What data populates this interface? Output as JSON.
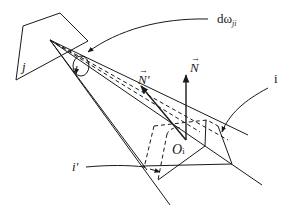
{
  "diagram": {
    "type": "radiation view-factor geometry",
    "colors": {
      "stroke": "#1a1a1a",
      "background": "#ffffff"
    },
    "labels": {
      "surface_j": "j",
      "solid_angle_main": "dω",
      "solid_angle_sub": "ji",
      "normal_N": "N",
      "normal_N_prime": "N′",
      "vector_arrow": "→",
      "surface_i": "i",
      "surface_i_prime": "i′",
      "origin_main": "O",
      "origin_sub": "i"
    }
  }
}
